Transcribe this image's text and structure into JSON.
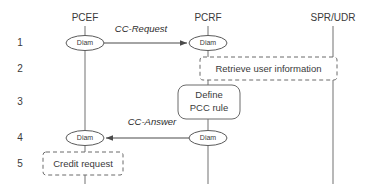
{
  "diagram": {
    "type": "sequence-diagram",
    "lifelines": [
      {
        "id": "pcef",
        "label": "PCEF",
        "x": 85
      },
      {
        "id": "pcrf",
        "label": "PCRF",
        "x": 208
      },
      {
        "id": "sprudr",
        "label": "SPR/UDR",
        "x": 333
      }
    ],
    "steps": [
      {
        "number": "1",
        "y": 43
      },
      {
        "number": "2",
        "y": 69
      },
      {
        "number": "3",
        "y": 102
      },
      {
        "number": "4",
        "y": 138
      },
      {
        "number": "5",
        "y": 164
      }
    ],
    "nodes": [
      {
        "id": "pcef-diam-1",
        "label": "Diam",
        "lifeline": "pcef",
        "step": "1"
      },
      {
        "id": "pcrf-diam-1",
        "label": "Diam",
        "lifeline": "pcrf",
        "step": "1"
      },
      {
        "id": "pcef-diam-4",
        "label": "Diam",
        "lifeline": "pcef",
        "step": "4"
      },
      {
        "id": "pcrf-diam-4",
        "label": "Diam",
        "lifeline": "pcrf",
        "step": "4"
      }
    ],
    "messages": [
      {
        "id": "cc-request",
        "label": "CC-Request",
        "from": "pcef",
        "to": "pcrf",
        "step": "1",
        "direction": "right"
      },
      {
        "id": "cc-answer",
        "label": "CC-Answer",
        "from": "pcrf",
        "to": "pcef",
        "step": "4",
        "direction": "left"
      }
    ],
    "boxes": [
      {
        "id": "retrieve-user-information",
        "label": "Retrieve user information",
        "style": "dashed",
        "step": "2",
        "spans": [
          "pcrf",
          "sprudr"
        ]
      },
      {
        "id": "define-pcc-rule",
        "label": "Define\nPCC rule",
        "label_line1": "Define",
        "label_line2": "PCC rule",
        "style": "solid-rounded",
        "step": "3",
        "spans": [
          "pcrf"
        ]
      },
      {
        "id": "credit-request",
        "label": "Credit request",
        "style": "dashed",
        "step": "5",
        "spans": [
          "pcef"
        ]
      }
    ],
    "colors": {
      "background": "#ffffff",
      "lifeline": "#9a9a9a",
      "stroke": "#5a5a5a",
      "text": "#3a3a3a",
      "arrow": "#4a4a4a"
    }
  }
}
